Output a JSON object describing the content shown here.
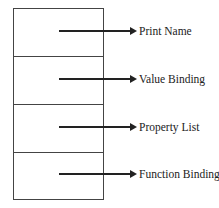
{
  "diagram": {
    "fields": [
      {
        "label": "Print Name"
      },
      {
        "label": "Value Binding"
      },
      {
        "label": "Property List"
      },
      {
        "label": "Function Binding"
      }
    ]
  }
}
